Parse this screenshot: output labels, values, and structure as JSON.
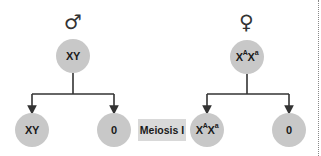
{
  "diagram": {
    "male": {
      "symbol": "♂",
      "genotype_parts": [
        {
          "text": "XY",
          "sup": ""
        }
      ],
      "products": [
        {
          "genotype_parts": [
            {
              "text": "XY",
              "sup": ""
            }
          ]
        },
        {
          "genotype_parts": [
            {
              "text": "0",
              "sup": ""
            }
          ]
        }
      ]
    },
    "female": {
      "symbol": "♀",
      "genotype_parts": [
        {
          "text": "X",
          "sup": "A"
        },
        {
          "text": "X",
          "sup": "a"
        }
      ],
      "products": [
        {
          "genotype_parts": [
            {
              "text": "X",
              "sup": "A"
            },
            {
              "text": "X",
              "sup": "a"
            }
          ]
        },
        {
          "genotype_parts": [
            {
              "text": "0",
              "sup": ""
            }
          ]
        }
      ]
    },
    "stage_label": "Meiosis I",
    "colors": {
      "node_fill": "#c8c8c8",
      "label_fill": "#d9d9d9",
      "line": "#333333"
    }
  },
  "labels": {
    "male_symbol": "♂",
    "female_symbol": "♀",
    "male_parent_main": "XY",
    "male_child1_main": "XY",
    "male_child2_main": "0",
    "female_parent_x1": "X",
    "female_parent_sup1": "A",
    "female_parent_x2": "X",
    "female_parent_sup2": "a",
    "female_child1_x1": "X",
    "female_child1_sup1": "A",
    "female_child1_x2": "X",
    "female_child1_sup2": "a",
    "female_child2_main": "0",
    "stage": "Meiosis I"
  }
}
